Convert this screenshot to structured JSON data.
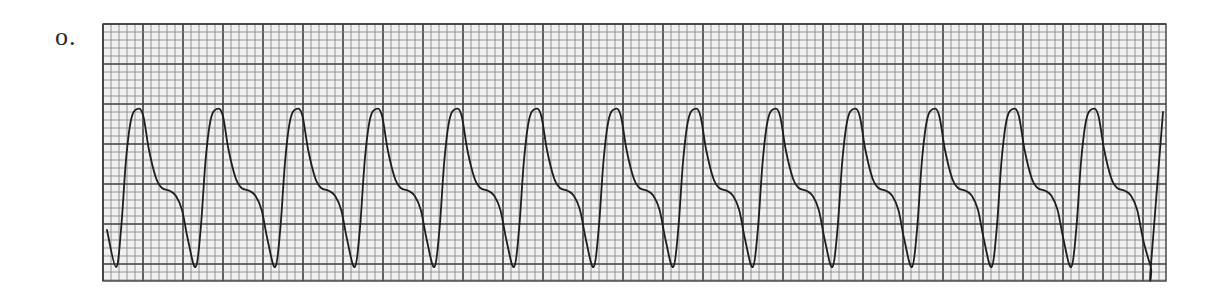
{
  "figure": {
    "label": "o."
  },
  "strip": {
    "x": 103,
    "y": 24,
    "width": 1063,
    "height": 257,
    "minor_grid_px": 8,
    "major_every": 5,
    "paper_color": "#f1f1f1",
    "minor_line_color": "#8a8a8a",
    "major_line_color": "#3c3c3c",
    "trace_color": "#1e1e1e"
  },
  "waveform": {
    "complex_count": 13,
    "period_px": 79.6,
    "first_trough_x": 116,
    "baseline_start": {
      "x": 107,
      "y": 230
    },
    "peak_y": 109,
    "trough_y": 267,
    "shape_offsets": [
      {
        "dx": 0,
        "y": 267
      },
      {
        "dx": 5,
        "y": 230
      },
      {
        "dx": 10,
        "y": 160
      },
      {
        "dx": 15,
        "y": 120
      },
      {
        "dx": 21,
        "y": 109
      },
      {
        "dx": 27,
        "y": 115
      },
      {
        "dx": 33,
        "y": 150
      },
      {
        "dx": 40,
        "y": 178
      },
      {
        "dx": 46,
        "y": 188
      },
      {
        "dx": 54,
        "y": 191
      },
      {
        "dx": 60,
        "y": 196
      },
      {
        "dx": 66,
        "y": 210
      },
      {
        "dx": 72,
        "y": 240
      },
      {
        "dx": 79.6,
        "y": 267
      }
    ],
    "end": {
      "x": 1163,
      "y": 112
    }
  }
}
